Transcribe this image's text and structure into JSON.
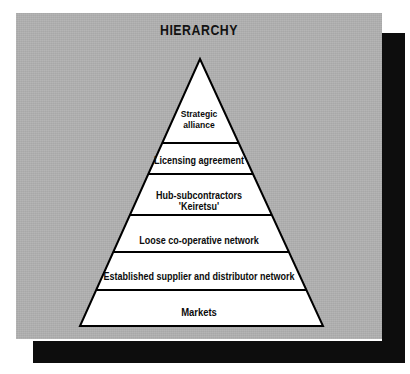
{
  "figure": {
    "title": "HIERARCHY",
    "type": "pyramid-hierarchy-diagram",
    "background_color": "#b1b1b1",
    "shadow_color": "#0d0d0d",
    "tier_fill_color": "#ffffff",
    "outline_color": "#000000"
  },
  "pyramid": {
    "apex": {
      "x": 184,
      "y": 46
    },
    "base_left": {
      "x": 64,
      "y": 313
    },
    "base_right": {
      "x": 307,
      "y": 313
    },
    "tiers": [
      {
        "index": 1,
        "label": "Strategic\nalliance",
        "lines": [
          "Strategic",
          "alliance"
        ],
        "level": "top",
        "font_size": 9.5,
        "center_y": 107
      },
      {
        "index": 2,
        "label": "Licensing agreement",
        "lines": [
          "Licensing agreement"
        ],
        "level": "2",
        "font_size": 10,
        "center_y": 148
      },
      {
        "index": 3,
        "label": "Hub-subcontractors\n'Keiretsu'",
        "lines": [
          "Hub-subcontractors",
          "'Keiretsu'"
        ],
        "level": "3",
        "font_size": 10,
        "center_y": 188
      },
      {
        "index": 4,
        "label": "Loose co-operative network",
        "lines": [
          "Loose co-operative network"
        ],
        "level": "4",
        "font_size": 10,
        "center_y": 228
      },
      {
        "index": 5,
        "label": "Established supplier and distributor network",
        "lines": [
          "Established supplier and distributor network"
        ],
        "level": "5",
        "font_size": 10,
        "center_y": 264
      },
      {
        "index": 6,
        "label": "Markets",
        "lines": [
          "Markets"
        ],
        "level": "base",
        "font_size": 10.5,
        "center_y": 300
      }
    ],
    "divider_y": [
      130,
      161,
      202,
      239,
      277
    ]
  }
}
